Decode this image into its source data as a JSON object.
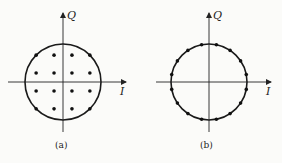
{
  "figure": {
    "panels": [
      {
        "id": "a",
        "caption": "(a)",
        "x_axis_label": "I",
        "y_axis_label": "Q",
        "constellation": "16-QAM",
        "points": [
          [
            -3,
            3
          ],
          [
            -1,
            3
          ],
          [
            1,
            3
          ],
          [
            3,
            3
          ],
          [
            -3,
            1
          ],
          [
            -1,
            1
          ],
          [
            1,
            1
          ],
          [
            3,
            1
          ],
          [
            -3,
            -1
          ],
          [
            -1,
            -1
          ],
          [
            1,
            -1
          ],
          [
            3,
            -1
          ],
          [
            -3,
            -3
          ],
          [
            -1,
            -3
          ],
          [
            1,
            -3
          ],
          [
            3,
            -3
          ]
        ],
        "circle_through": "corner points"
      },
      {
        "id": "b",
        "caption": "(b)",
        "x_axis_label": "I",
        "y_axis_label": "Q",
        "constellation": "16-PSK",
        "num_points": 16,
        "phase_offset_deg": 11.25
      }
    ]
  }
}
